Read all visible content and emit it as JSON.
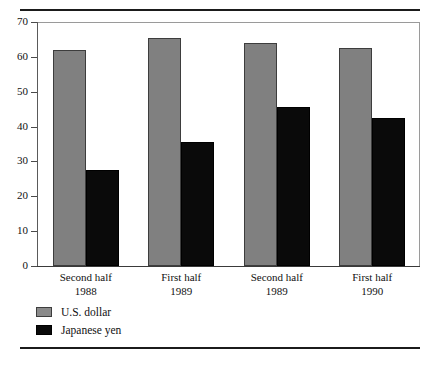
{
  "chart_data": {
    "type": "bar",
    "title": "",
    "subtitle": "",
    "xlabel": "",
    "ylabel": "",
    "ylim": [
      0,
      70
    ],
    "yticks": [
      0,
      10,
      20,
      30,
      40,
      50,
      60,
      70
    ],
    "grid": false,
    "legend_position": "bottom-left",
    "categories": [
      {
        "line1": "Second half",
        "line2": "1988"
      },
      {
        "line1": "First half",
        "line2": "1989"
      },
      {
        "line1": "Second half",
        "line2": "1989"
      },
      {
        "line1": "First half",
        "line2": "1990"
      }
    ],
    "category_labels": [
      "Second half 1988",
      "First half 1989",
      "Second half 1989",
      "First half 1990"
    ],
    "series": [
      {
        "name": "U.S. dollar",
        "color": "#808080",
        "values": [
          62.0,
          65.5,
          64.0,
          62.5
        ]
      },
      {
        "name": "Japanese yen",
        "color": "#0a0a0a",
        "values": [
          27.5,
          35.5,
          45.5,
          42.5
        ]
      }
    ]
  },
  "legend": {
    "items": [
      {
        "label": "U.S. dollar",
        "swatch": "gray-swatch-icon"
      },
      {
        "label": "Japanese yen",
        "swatch": "black-swatch-icon"
      }
    ]
  },
  "axis": {
    "y_tick_labels": [
      "70",
      "60",
      "50",
      "40",
      "30",
      "20",
      "10",
      "0"
    ]
  }
}
